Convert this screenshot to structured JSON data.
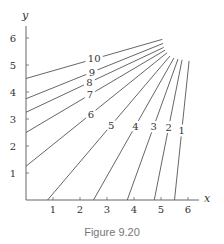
{
  "figure": {
    "caption": "Figure 9.20",
    "colors": {
      "line": "#555555",
      "text": "#333333",
      "caption": "#777777"
    }
  },
  "chart_data": {
    "type": "line",
    "title": "",
    "caption": "Figure 9.20",
    "xlabel": "x",
    "ylabel": "y",
    "xlim": [
      0,
      6.5
    ],
    "ylim": [
      0,
      6.4
    ],
    "xticks": [
      1,
      2,
      3,
      4,
      5,
      6
    ],
    "yticks": [
      1,
      2,
      3,
      4,
      5,
      6
    ],
    "grid": false,
    "legend": "none (contour values labeled inline)",
    "series": [
      {
        "name": "10",
        "points": [
          [
            0,
            4.5
          ],
          [
            5.05,
            5.95
          ]
        ]
      },
      {
        "name": "9",
        "points": [
          [
            0,
            3.75
          ],
          [
            5.08,
            5.8
          ]
        ]
      },
      {
        "name": "8",
        "points": [
          [
            0,
            3.25
          ],
          [
            5.1,
            5.65
          ]
        ]
      },
      {
        "name": "7",
        "points": [
          [
            0,
            2.5
          ],
          [
            5.15,
            5.55
          ]
        ]
      },
      {
        "name": "6",
        "points": [
          [
            0,
            1.25
          ],
          [
            5.22,
            5.45
          ]
        ]
      },
      {
        "name": "5",
        "points": [
          [
            0.8,
            0
          ],
          [
            5.33,
            5.33
          ]
        ]
      },
      {
        "name": "4",
        "points": [
          [
            2.5,
            0
          ],
          [
            5.48,
            5.26
          ]
        ]
      },
      {
        "name": "3",
        "points": [
          [
            3.75,
            0
          ],
          [
            5.63,
            5.22
          ]
        ]
      },
      {
        "name": "2",
        "points": [
          [
            4.75,
            0
          ],
          [
            5.78,
            5.19
          ]
        ]
      },
      {
        "name": "1",
        "points": [
          [
            5.5,
            0
          ],
          [
            6.04,
            5.15
          ]
        ]
      }
    ]
  }
}
